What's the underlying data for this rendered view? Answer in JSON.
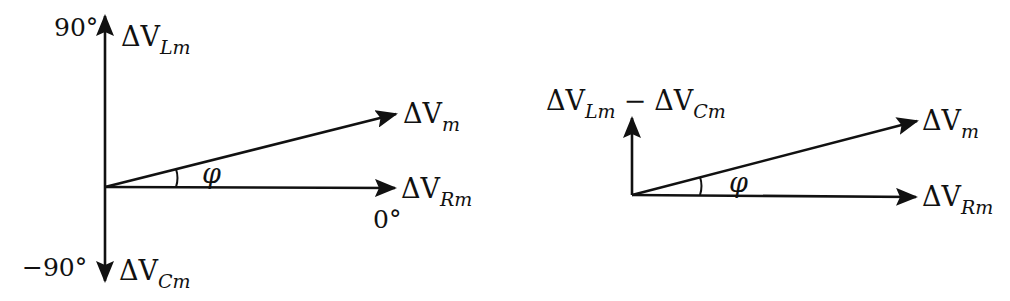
{
  "diagram": {
    "type": "phasor-diagram",
    "colors": {
      "ink": "#111111",
      "background": "#ffffff"
    },
    "left": {
      "labels": {
        "top_angle": "90°",
        "top_vector": {
          "base": "ΔV",
          "sub": "Lm"
        },
        "bottom_angle": "−90°",
        "bottom_vector": {
          "base": "ΔV",
          "sub": "Cm"
        },
        "resultant_vector": {
          "base": "ΔV",
          "sub": "m"
        },
        "real_vector": {
          "base": "ΔV",
          "sub": "Rm"
        },
        "zero_angle": "0°",
        "angle_symbol": "φ"
      }
    },
    "right": {
      "labels": {
        "net_reactive_vector": {
          "first": {
            "base": "ΔV",
            "sub": "Lm"
          },
          "operator": "−",
          "second": {
            "base": "ΔV",
            "sub": "Cm"
          }
        },
        "resultant_vector": {
          "base": "ΔV",
          "sub": "m"
        },
        "real_vector": {
          "base": "ΔV",
          "sub": "Rm"
        },
        "angle_symbol": "φ"
      }
    }
  }
}
